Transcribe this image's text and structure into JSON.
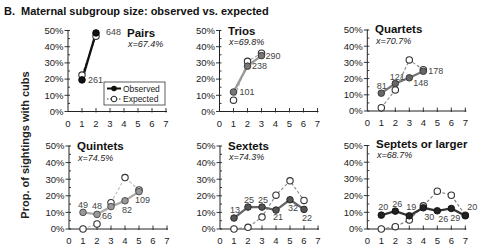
{
  "header": {
    "panel_letter": "B.",
    "title": "Maternal subgroup size: observed vs. expected"
  },
  "y_axis_label": "Prop. of sightings with cubs",
  "legend": {
    "observed": "Observed",
    "expected": "Expected"
  },
  "chart_data": [
    {
      "type": "line",
      "title": "Pairs",
      "mean_label": "x=67.4%",
      "xlabel": "",
      "ylabel": "Prop. of sightings with cubs",
      "xlim": [
        0,
        7
      ],
      "ylim": [
        0,
        50
      ],
      "xticks": [
        "0",
        "1",
        "2",
        "3",
        "4",
        "5",
        "6",
        "7"
      ],
      "yticks": [
        "0%",
        "10%",
        "20%",
        "30%",
        "40%",
        "50%"
      ],
      "x": [
        1,
        2
      ],
      "series": [
        {
          "name": "Observed",
          "values": [
            19.5,
            48.5
          ]
        },
        {
          "name": "Expected",
          "values": [
            22.5,
            46.5
          ]
        }
      ],
      "point_labels": [
        "261",
        "648"
      ],
      "label_offsets": [
        [
          6,
          3
        ],
        [
          10,
          2
        ]
      ],
      "colors": {
        "observed_fill": "#111111",
        "observed_stroke": "#000000",
        "observed_line": "#111111",
        "expected_line": "#555555"
      },
      "legend_position": "lower right"
    },
    {
      "type": "line",
      "title": "Trios",
      "mean_label": "x=69.8%",
      "xlabel": "",
      "ylabel": "",
      "xlim": [
        0,
        7
      ],
      "ylim": [
        0,
        50
      ],
      "xticks": [
        "0",
        "1",
        "2",
        "3",
        "4",
        "5",
        "6",
        "7"
      ],
      "yticks": [
        "0%",
        "10%",
        "20%",
        "30%",
        "40%",
        "50%"
      ],
      "x": [
        1,
        2,
        3
      ],
      "series": [
        {
          "name": "Observed",
          "values": [
            12,
            28,
            34.5
          ]
        },
        {
          "name": "Expected",
          "values": [
            7,
            31,
            36
          ]
        }
      ],
      "point_labels": [
        "101",
        "238",
        "290"
      ],
      "label_offsets": [
        [
          6,
          3
        ],
        [
          4.5,
          3
        ],
        [
          4,
          3
        ]
      ],
      "colors": {
        "observed_fill": "#777777",
        "observed_stroke": "#333333",
        "observed_line": "#999999",
        "expected_line": "#aaaaaa"
      }
    },
    {
      "type": "line",
      "title": "Quartets",
      "mean_label": "x=70.7%",
      "xlabel": "",
      "ylabel": "",
      "xlim": [
        0,
        7
      ],
      "ylim": [
        0,
        50
      ],
      "xticks": [
        "0",
        "1",
        "2",
        "3",
        "4",
        "5",
        "6",
        "7"
      ],
      "yticks": [
        "0%",
        "10%",
        "20%",
        "30%",
        "40%",
        "50%"
      ],
      "x": [
        1,
        2,
        3,
        4
      ],
      "series": [
        {
          "name": "Observed",
          "values": [
            11,
            17,
            20.5,
            24.5
          ]
        },
        {
          "name": "Expected",
          "values": [
            2,
            13,
            31.5,
            25.5
          ]
        }
      ],
      "point_labels": [
        "81",
        "121",
        "148",
        "178"
      ],
      "label_offsets": [
        [
          -4.5,
          -4
        ],
        [
          -5.5,
          -3
        ],
        [
          4,
          8
        ],
        [
          5,
          3
        ]
      ],
      "colors": {
        "observed_fill": "#666666",
        "observed_stroke": "#333333",
        "observed_line": "#777777",
        "expected_line": "#888888"
      }
    },
    {
      "type": "line",
      "title": "Quintets",
      "mean_label": "x=74.5%",
      "xlabel": "",
      "ylabel": "",
      "xlim": [
        0,
        7
      ],
      "ylim": [
        0,
        50
      ],
      "xticks": [
        "0",
        "1",
        "2",
        "3",
        "4",
        "5",
        "6",
        "7"
      ],
      "yticks": [
        "0%",
        "10%",
        "20%",
        "30%",
        "40%",
        "50%"
      ],
      "x": [
        1,
        2,
        3,
        4,
        5
      ],
      "series": [
        {
          "name": "Observed",
          "values": [
            10,
            8.8,
            13.5,
            17,
            22.5
          ]
        },
        {
          "name": "Expected",
          "values": [
            0,
            3,
            15.8,
            31,
            23.5
          ]
        }
      ],
      "point_labels": [
        "49",
        "48",
        "66",
        "82",
        "109"
      ],
      "label_offsets": [
        [
          -5,
          -4
        ],
        [
          -5,
          -5
        ],
        [
          -9,
          12
        ],
        [
          -3,
          12
        ],
        [
          -4,
          11
        ]
      ],
      "colors": {
        "observed_fill": "#999999",
        "observed_stroke": "#444444",
        "observed_line": "#aaaaaa",
        "expected_line": "#bbbbbb"
      }
    },
    {
      "type": "line",
      "title": "Sextets",
      "mean_label": "x=74.3%",
      "xlabel": "",
      "ylabel": "",
      "xlim": [
        0,
        7
      ],
      "ylim": [
        0,
        50
      ],
      "xticks": [
        "0",
        "1",
        "2",
        "3",
        "4",
        "5",
        "6",
        "7"
      ],
      "yticks": [
        "0%",
        "10%",
        "20%",
        "30%",
        "40%",
        "50%"
      ],
      "x": [
        1,
        2,
        3,
        4,
        5,
        6
      ],
      "series": [
        {
          "name": "Observed",
          "values": [
            6.6,
            13.2,
            13.2,
            11.4,
            17.6,
            11.8
          ]
        },
        {
          "name": "Expected",
          "values": [
            0,
            1,
            7.2,
            20.4,
            29,
            17.2
          ]
        }
      ],
      "point_labels": [
        "13",
        "25",
        "25",
        "21",
        "32",
        "22"
      ],
      "label_offsets": [
        [
          -4,
          -5
        ],
        [
          -4,
          -4
        ],
        [
          -4,
          -4
        ],
        [
          -3,
          10
        ],
        [
          -2,
          11
        ],
        [
          -2,
          12
        ]
      ],
      "colors": {
        "observed_fill": "#555555",
        "observed_stroke": "#222222",
        "observed_line": "#666666",
        "expected_line": "#888888"
      }
    },
    {
      "type": "line",
      "title": "Septets or larger",
      "mean_label": "x=68.7%",
      "xlabel": "",
      "ylabel": "",
      "xlim": [
        0,
        7
      ],
      "ylim": [
        0,
        50
      ],
      "xticks": [
        "0",
        "1",
        "2",
        "3",
        "4",
        "5",
        "6",
        "7"
      ],
      "yticks": [
        "0%",
        "10%",
        "20%",
        "30%",
        "40%",
        "50%"
      ],
      "x": [
        1,
        2,
        3,
        4,
        5,
        6,
        7
      ],
      "series": [
        {
          "name": "Observed",
          "values": [
            8.3,
            10.7,
            7.9,
            12.7,
            10.9,
            12.3,
            7.9
          ]
        },
        {
          "name": "Expected",
          "values": [
            0,
            1.4,
            5.4,
            13.9,
            22.6,
            20.2,
            8.3
          ]
        }
      ],
      "point_labels": [
        "20",
        "26",
        "19",
        "30",
        "26",
        "29",
        "20"
      ],
      "label_offsets": [
        [
          -3,
          -5
        ],
        [
          -3,
          -4
        ],
        [
          -3,
          -6
        ],
        [
          1,
          12
        ],
        [
          1,
          11
        ],
        [
          -1,
          13
        ],
        [
          2,
          -6
        ]
      ],
      "colors": {
        "observed_fill": "#222222",
        "observed_stroke": "#111111",
        "observed_line": "#333333",
        "expected_line": "#777777"
      }
    }
  ]
}
